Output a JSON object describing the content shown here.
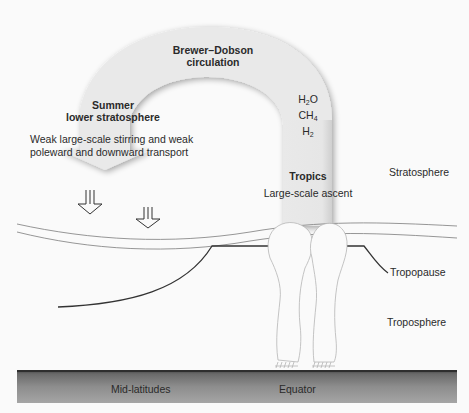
{
  "diagram": {
    "title": "Brewer–Dobson circulation",
    "circulation_label_line1": "Brewer–Dobson",
    "circulation_label_line2": "circulation",
    "summer_label_line1": "Summer",
    "summer_label_line2": "lower stratosphere",
    "transport_text_line1": "Weak large-scale stirring and weak",
    "transport_text_line2": "poleward and downward transport",
    "species": [
      {
        "base": "H",
        "sub": "2",
        "tail": "O"
      },
      {
        "base": "CH",
        "sub": "4",
        "tail": ""
      },
      {
        "base": "H",
        "sub": "2",
        "tail": ""
      }
    ],
    "tropics_label": "Tropics",
    "ascent_label": "Large-scale ascent",
    "layers": {
      "stratosphere": "Stratosphere",
      "tropopause": "Tropopause",
      "troposphere": "Troposphere"
    },
    "ground": {
      "left": "Mid-latitudes",
      "right": "Equator"
    },
    "colors": {
      "arch_fill": "#e8e8e8",
      "arch_shadow": "#b8b8b8",
      "line": "#3a3a3a",
      "ground_dark": "#555555",
      "ground_light": "#9a9a9a"
    }
  }
}
